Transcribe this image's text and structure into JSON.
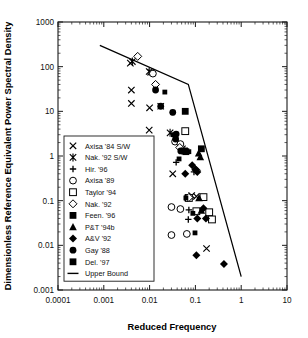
{
  "chart_data": {
    "type": "scatter",
    "title": "",
    "xlabel": "Reduced Frequency",
    "ylabel": "Dimensionless Reference Equivalent Power Spectral Density",
    "xscale": "log",
    "yscale": "log",
    "xlim": [
      0.0001,
      10
    ],
    "ylim": [
      0.001,
      1000
    ],
    "grid": false,
    "legend_position": "center-left",
    "xticks": [
      "0.0001",
      "0.001",
      "0.01",
      "0.1",
      "1",
      "10"
    ],
    "xtick_values": [
      0.0001,
      0.001,
      0.01,
      0.1,
      1,
      10
    ],
    "yticks": [
      "0.001",
      "0.01",
      "0.1",
      "1",
      "10",
      "100",
      "1000"
    ],
    "ytick_values": [
      0.001,
      0.01,
      0.1,
      1,
      10,
      100,
      1000
    ],
    "series": [
      {
        "name": "Axisa '84 S/W",
        "marker": "x",
        "filled": false,
        "points": [
          [
            0.0038,
            120.0
          ],
          [
            0.004,
            30.0
          ],
          [
            0.004,
            15.0
          ],
          [
            0.0105,
            75.0
          ],
          [
            0.01,
            12.0
          ],
          [
            0.0098,
            3.8
          ],
          [
            0.0175,
            13.0
          ],
          [
            0.032,
            0.4
          ],
          [
            0.083,
            0.13
          ],
          [
            0.105,
            0.125
          ],
          [
            0.175,
            0.0085
          ]
        ]
      },
      {
        "name": "Nak. '92 S/W",
        "marker": "star",
        "filled": false,
        "points": [
          [
            0.0042,
            130.0
          ],
          [
            0.0098,
            78.0
          ],
          [
            0.028,
            3.3
          ],
          [
            0.068,
            0.115
          ],
          [
            0.052,
            1.45
          ]
        ]
      },
      {
        "name": "Hir. '96",
        "marker": "plus",
        "filled": false,
        "points": [
          [
            0.038,
            0.72
          ],
          [
            0.072,
            0.062
          ],
          [
            0.07,
            0.038
          ],
          [
            0.093,
            0.44
          ]
        ]
      },
      {
        "name": "Axisa '89",
        "marker": "circle-open",
        "filled": false,
        "points": [
          [
            0.0118,
            70.0
          ],
          [
            0.036,
            2.1
          ],
          [
            0.047,
            1.85
          ],
          [
            0.03,
            0.072
          ],
          [
            0.03,
            0.017
          ],
          [
            0.047,
            0.065
          ],
          [
            0.065,
            0.018
          ]
        ]
      },
      {
        "name": "Taylor '94",
        "marker": "square-open",
        "filled": false,
        "points": [
          [
            0.06,
            3.6
          ],
          [
            0.072,
            0.115
          ],
          [
            0.105,
            0.058
          ],
          [
            0.15,
            0.12
          ],
          [
            0.2,
            0.055
          ],
          [
            0.23,
            0.038
          ]
        ]
      },
      {
        "name": "Nak. '92",
        "marker": "diamond-open",
        "filled": false,
        "points": [
          [
            0.0055,
            170.0
          ],
          [
            0.0135,
            40.0
          ],
          [
            0.0455,
            1.55
          ],
          [
            0.105,
            0.48
          ],
          [
            0.072,
            0.118
          ]
        ]
      },
      {
        "name": "Feen. '96",
        "marker": "square",
        "filled": true,
        "points": [
          [
            0.06,
            10.0
          ],
          [
            0.135,
            1.45
          ],
          [
            0.058,
            1.3
          ],
          [
            0.062,
            1.25
          ]
        ]
      },
      {
        "name": "P&T '94b",
        "marker": "triangle",
        "filled": true,
        "points": [
          [
            0.12,
            0.115
          ],
          [
            0.135,
            0.06
          ],
          [
            0.118,
            1.15
          ],
          [
            0.128,
            0.95
          ]
        ]
      },
      {
        "name": "A&V '92",
        "marker": "diamond",
        "filled": true,
        "points": [
          [
            0.085,
            0.62
          ],
          [
            0.1,
            0.5
          ],
          [
            0.06,
            0.4
          ],
          [
            0.11,
            0.44
          ],
          [
            0.15,
            0.068
          ],
          [
            0.11,
            0.04
          ],
          [
            0.105,
            0.006
          ],
          [
            0.17,
            0.04
          ],
          [
            0.42,
            0.0038
          ]
        ]
      },
      {
        "name": "Gay '88",
        "marker": "circle",
        "filled": true,
        "points": [
          [
            0.0135,
            30.0
          ],
          [
            0.0175,
            13.0
          ],
          [
            0.032,
            9.5
          ],
          [
            0.038,
            3.1
          ],
          [
            0.037,
            2.4
          ],
          [
            0.048,
            1.3
          ]
        ]
      },
      {
        "name": "Del. '97",
        "marker": "square-small",
        "filled": true,
        "points": [
          [
            0.0215,
            27.0
          ],
          [
            0.032,
            9.3
          ],
          [
            0.033,
            3.0
          ],
          [
            0.044,
            0.86
          ],
          [
            0.072,
            1.25
          ],
          [
            0.088,
            0.052
          ],
          [
            0.098,
            0.019
          ],
          [
            0.062,
            0.115
          ]
        ]
      }
    ],
    "bound": {
      "name": "Upper Bound",
      "style": "line",
      "points": [
        [
          0.00082,
          300.0
        ],
        [
          0.07,
          40.0
        ],
        [
          1.0,
          0.002
        ]
      ]
    }
  },
  "legend": {
    "entries": [
      {
        "label": "Axisa '84 S/W",
        "icon": "x-marker-icon"
      },
      {
        "label": "Nak. '92 S/W",
        "icon": "star-marker-icon"
      },
      {
        "label": "Hir. '96",
        "icon": "plus-marker-icon"
      },
      {
        "label": "Axisa '89",
        "icon": "circle-open-marker-icon"
      },
      {
        "label": "Taylor '94",
        "icon": "square-open-marker-icon"
      },
      {
        "label": "Nak. '92",
        "icon": "diamond-open-marker-icon"
      },
      {
        "label": "Feen. '96",
        "icon": "square-filled-marker-icon"
      },
      {
        "label": "P&T '94b",
        "icon": "triangle-filled-marker-icon"
      },
      {
        "label": "A&V '92",
        "icon": "diamond-filled-marker-icon"
      },
      {
        "label": "Gay '88",
        "icon": "circle-filled-marker-icon"
      },
      {
        "label": "Del. '97",
        "icon": "square-filled-marker-icon"
      },
      {
        "label": "Upper Bound",
        "icon": "line-marker-icon"
      }
    ]
  },
  "colors": {
    "foreground": "#000000",
    "background": "#ffffff",
    "axis": "#1a1a1a"
  }
}
